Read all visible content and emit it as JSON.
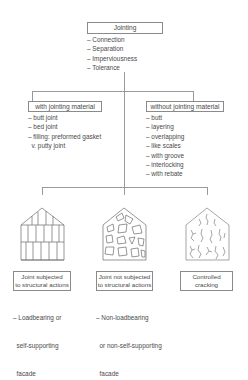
{
  "root": {
    "title": "Jointing",
    "items": [
      "– Connection",
      "– Separation",
      "– Imperviousness",
      "– Tolerance"
    ]
  },
  "branches": [
    {
      "title": "with jointing material",
      "items": [
        "– butt joint",
        "– bed joint",
        "– filling: preformed gasket",
        "  v. putty joint"
      ]
    },
    {
      "title": "without jointing material",
      "items": [
        "– butt",
        "– layering",
        "– overlapping",
        "– like scales",
        "– with groove",
        "– interlocking",
        "– with rebate"
      ]
    }
  ],
  "types": [
    {
      "icon": "vertical-panel-facade-icon",
      "title_line1": "Joint subjected",
      "title_line2": "to structural actions",
      "note": [
        "– Loadbearing or",
        "  self-supporting",
        "  facade"
      ]
    },
    {
      "icon": "random-stone-facade-icon",
      "title_line1": "Joint not subjected",
      "title_line2": "to structural actions",
      "note": [
        "– Non-loadbearing",
        "  or non-self-supporting",
        "  facade"
      ]
    },
    {
      "icon": "cracked-facade-icon",
      "title_line1": "Controlled",
      "title_line2": "cracking",
      "note": []
    }
  ],
  "colors": {
    "line": "#9a9a9a",
    "text": "#4a4a4a",
    "border": "#8a8a8a"
  }
}
